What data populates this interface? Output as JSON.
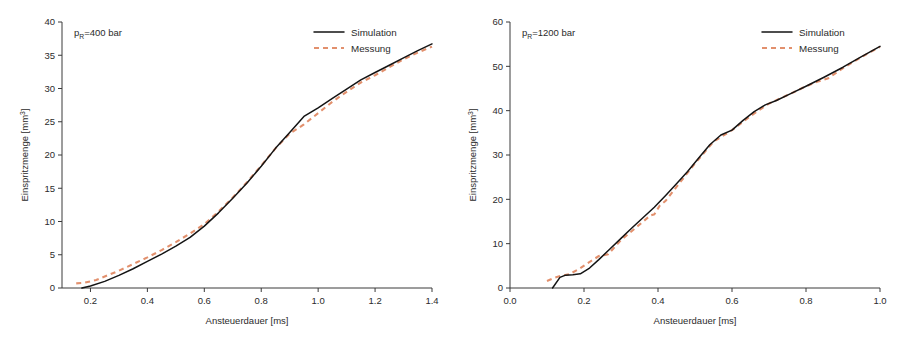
{
  "figure": {
    "background": "#ffffff",
    "panel_count": 2
  },
  "colors": {
    "simulation": "#141414",
    "messung": "#e2906d",
    "axis": "#3a3a3a",
    "text": "#2b2b2b"
  },
  "chart_data": [
    {
      "type": "line",
      "panel": "left",
      "title": "",
      "annotation": "p_R=400 bar",
      "annotation_parts": {
        "symbol": "p",
        "subscript": "R",
        "rest": "=400 bar"
      },
      "xlabel": "Ansteuerdauer [ms]",
      "ylabel": "Einspritzmenge [mm³]",
      "ylabel_parts": {
        "text": "Einspritzmenge [mm",
        "superscript": "3",
        "tail": "]"
      },
      "xlim": [
        0.1,
        1.4
      ],
      "ylim": [
        0,
        40
      ],
      "xticks": [
        0.2,
        0.4,
        0.6,
        0.8,
        1.0,
        1.2,
        1.4
      ],
      "xtick_labels": [
        "0.2",
        "0.4",
        "0.6",
        "0.8",
        "1.0",
        "1.2",
        "1.4"
      ],
      "yticks": [
        0,
        5,
        10,
        15,
        20,
        25,
        30,
        35,
        40
      ],
      "ytick_labels": [
        "0",
        "5",
        "10",
        "15",
        "20",
        "25",
        "30",
        "35",
        "40"
      ],
      "grid": false,
      "legend_position": "top-right",
      "series": [
        {
          "name": "Simulation",
          "style": "solid",
          "color": "#141414",
          "x": [
            0.17,
            0.2,
            0.25,
            0.3,
            0.35,
            0.4,
            0.45,
            0.5,
            0.55,
            0.6,
            0.65,
            0.7,
            0.75,
            0.8,
            0.85,
            0.9,
            0.95,
            1.0,
            1.05,
            1.1,
            1.15,
            1.2,
            1.25,
            1.3,
            1.35,
            1.4
          ],
          "y": [
            0.0,
            0.3,
            1.0,
            1.9,
            2.9,
            4.0,
            5.1,
            6.3,
            7.6,
            9.3,
            11.3,
            13.5,
            15.8,
            18.3,
            21.0,
            23.4,
            25.8,
            27.1,
            28.5,
            29.9,
            31.3,
            32.4,
            33.5,
            34.6,
            35.7,
            36.7
          ]
        },
        {
          "name": "Messung",
          "style": "dashed",
          "color": "#e2906d",
          "x": [
            0.15,
            0.18,
            0.22,
            0.26,
            0.3,
            0.35,
            0.4,
            0.45,
            0.5,
            0.55,
            0.6,
            0.65,
            0.7,
            0.75,
            0.8,
            0.85,
            0.9,
            0.95,
            1.0,
            1.05,
            1.1,
            1.15,
            1.2,
            1.25,
            1.3,
            1.35,
            1.4
          ],
          "y": [
            0.7,
            0.8,
            1.2,
            1.9,
            2.6,
            3.6,
            4.6,
            5.7,
            6.9,
            8.2,
            9.6,
            11.5,
            13.6,
            15.9,
            18.4,
            21.0,
            23.2,
            24.6,
            26.3,
            28.0,
            29.5,
            30.9,
            32.0,
            33.2,
            34.4,
            35.4,
            36.3
          ]
        }
      ]
    },
    {
      "type": "line",
      "panel": "right",
      "title": "",
      "annotation": "p_R=1200 bar",
      "annotation_parts": {
        "symbol": "p",
        "subscript": "R",
        "rest": "=1200 bar"
      },
      "xlabel": "Ansteuerdauer [ms]",
      "ylabel": "Einspritzmenge [mm³]",
      "ylabel_parts": {
        "text": "Einspritzmenge [mm",
        "superscript": "3",
        "tail": "]"
      },
      "xlim": [
        0.0,
        1.0
      ],
      "ylim": [
        0,
        60
      ],
      "xticks": [
        0.0,
        0.2,
        0.4,
        0.6,
        0.8,
        1.0
      ],
      "xtick_labels": [
        "0.0",
        "0.2",
        "0.4",
        "0.6",
        "0.8",
        "1.0"
      ],
      "yticks": [
        0,
        10,
        20,
        30,
        40,
        50,
        60
      ],
      "ytick_labels": [
        "0",
        "10",
        "20",
        "30",
        "40",
        "50",
        "60"
      ],
      "grid": false,
      "legend_position": "top-right",
      "series": [
        {
          "name": "Simulation",
          "style": "solid",
          "color": "#141414",
          "x": [
            0.115,
            0.135,
            0.15,
            0.17,
            0.19,
            0.215,
            0.24,
            0.27,
            0.3,
            0.33,
            0.36,
            0.39,
            0.42,
            0.45,
            0.48,
            0.51,
            0.54,
            0.57,
            0.6,
            0.63,
            0.66,
            0.69,
            0.72,
            0.76,
            0.8,
            0.85,
            0.9,
            0.95,
            1.0
          ],
          "y": [
            0.0,
            2.4,
            2.9,
            3.0,
            3.2,
            4.5,
            6.4,
            8.8,
            11.2,
            13.6,
            15.9,
            18.2,
            20.8,
            23.5,
            26.3,
            29.3,
            32.3,
            34.5,
            35.6,
            37.8,
            39.8,
            41.3,
            42.3,
            43.9,
            45.5,
            47.6,
            49.8,
            52.2,
            54.5
          ]
        },
        {
          "name": "Messung",
          "style": "dashed",
          "color": "#e2906d",
          "x": [
            0.1,
            0.12,
            0.14,
            0.16,
            0.185,
            0.21,
            0.24,
            0.265,
            0.3,
            0.34,
            0.38,
            0.39,
            0.405,
            0.42,
            0.45,
            0.5,
            0.55,
            0.6,
            0.65,
            0.7,
            0.76,
            0.8,
            0.83,
            0.86,
            0.9,
            0.95,
            1.0
          ],
          "y": [
            1.6,
            2.3,
            2.8,
            3.1,
            4.2,
            5.6,
            7.2,
            7.6,
            10.8,
            13.6,
            16.4,
            16.6,
            18.6,
            19.6,
            22.8,
            28.1,
            33.0,
            35.6,
            38.8,
            41.6,
            43.9,
            45.5,
            46.5,
            47.3,
            49.6,
            52.1,
            54.4
          ]
        }
      ]
    }
  ],
  "legend": {
    "entries": [
      {
        "label": "Simulation",
        "style": "solid"
      },
      {
        "label": "Messung",
        "style": "dashed"
      }
    ]
  }
}
